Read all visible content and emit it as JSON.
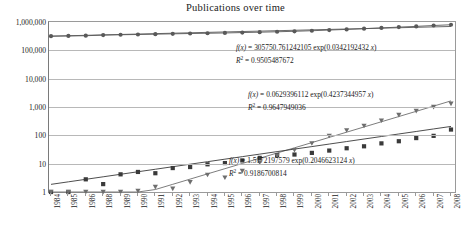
{
  "chart_data": {
    "type": "scatter",
    "title": "Publications over time",
    "xlabel": "",
    "ylabel": "",
    "yscale": "log",
    "ylim": [
      1,
      1000000
    ],
    "grid": true,
    "legend": "none",
    "categories": [
      "1984",
      "1985",
      "1986",
      "1988",
      "1989",
      "1990",
      "1991",
      "1992",
      "1993",
      "1994",
      "1995",
      "1996",
      "1997",
      "1998",
      "1999",
      "2000",
      "2001",
      "2002",
      "2003",
      "2004",
      "2005",
      "2006",
      "2007",
      "2008"
    ],
    "ytick_labels": [
      "1,000,000",
      "100,000",
      "10,000",
      "1,000",
      "100",
      "10",
      "1"
    ],
    "ytick_values": [
      1000000,
      100000,
      10000,
      1000,
      100,
      10,
      1
    ],
    "xtick_labels": [
      "1984",
      "1985",
      "1986",
      "1988",
      "1989",
      "1990",
      "1991",
      "1992",
      "1993",
      "1994",
      "1995",
      "1996",
      "1997",
      "1998",
      "1999",
      "2000",
      "2001",
      "2002",
      "2003",
      "2004",
      "2005",
      "2006",
      "2007",
      "2008"
    ],
    "series": [
      {
        "name": "all-publications",
        "marker": "diamond",
        "color": "#595959",
        "values": [
          316000,
          322000,
          328000,
          345000,
          355000,
          362000,
          372000,
          382000,
          392000,
          400000,
          410000,
          424000,
          437000,
          452000,
          470000,
          492000,
          520000,
          548000,
          580000,
          618000,
          660000,
          700000,
          752000,
          800000
        ]
      },
      {
        "name": "square-series",
        "marker": "square",
        "color": "#3a3a3a",
        "values": [
          1,
          1,
          2.8,
          1.9,
          4.2,
          5.1,
          4.6,
          7.0,
          7.6,
          9.5,
          10.5,
          13,
          16,
          20,
          21,
          24,
          29,
          35,
          41,
          52,
          62,
          80,
          96,
          160
        ]
      },
      {
        "name": "triangle-series",
        "marker": "triangle",
        "color": "#6e6e6e",
        "values": [
          1,
          1,
          1,
          1,
          1,
          1.1,
          1.5,
          1.3,
          2.2,
          4.0,
          3.2,
          5.5,
          11,
          19,
          30,
          52,
          95,
          150,
          215,
          330,
          520,
          720,
          1000,
          1300
        ]
      }
    ],
    "fits": [
      {
        "for": "all-publications",
        "equation": "f(x) = 305750.761242105 exp(0.0342192432 x)",
        "a": 305750.761242105,
        "b": 0.0342192432,
        "r2_label": "R² = 0.9505487672",
        "r2": 0.9505487672
      },
      {
        "for": "triangle-series",
        "equation": "f(x) = 0.0629396112 exp(0.4237344957 x)",
        "a": 0.0629396112,
        "b": 0.4237344957,
        "r2_label": "R² = 0.9647949036",
        "r2": 0.9647949036
      },
      {
        "for": "square-series",
        "equation": "f(x) = 1.5172197579 exp(0.2046623124 x)",
        "a": 1.5172197579,
        "b": 0.2046623124,
        "r2_label": "R² = 0.9186700814",
        "r2": 0.9186700814
      }
    ],
    "annotations": [
      {
        "id": "eq1",
        "fx": "f(x)",
        "rest": " = 305750.761242105 exp(0.0342192432 ",
        "xvar": "x",
        "tail": ")",
        "r2pre": "R",
        "r2post": " = 0.9505487672"
      },
      {
        "id": "eq2",
        "fx": "f(x)",
        "rest": " = 0.0629396112 exp(0.4237344957 ",
        "xvar": "x",
        "tail": ")",
        "r2pre": "R",
        "r2post": " = 0.9647949036"
      },
      {
        "id": "eq3",
        "fx": "f(x)",
        "rest": " = 1.5172197579 exp(0.2046623124 ",
        "xvar": "x",
        "tail": ")",
        "r2pre": "R",
        "r2post": " = 0.9186700814"
      }
    ]
  }
}
